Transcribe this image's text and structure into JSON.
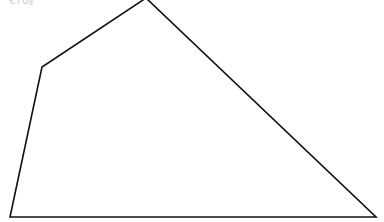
{
  "diagram": {
    "corner_label": "€70₈",
    "shape": "quadrilateral",
    "stroke_color": "#111111",
    "fill_color": "#ffffff",
    "vertices": [
      {
        "x": 146,
        "y": -2
      },
      {
        "x": 376,
        "y": 217
      },
      {
        "x": 10,
        "y": 217
      },
      {
        "x": 42,
        "y": 67
      }
    ]
  }
}
